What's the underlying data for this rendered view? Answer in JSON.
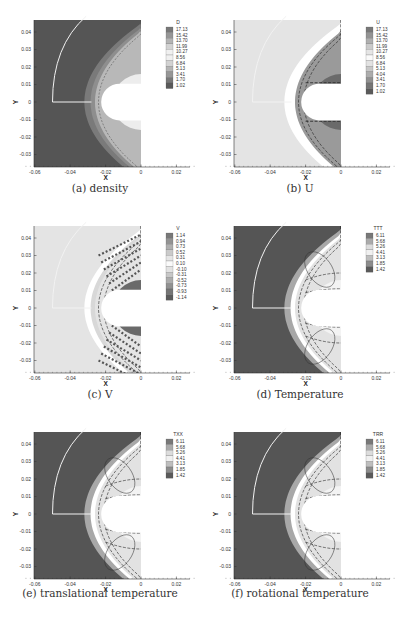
{
  "figure": {
    "panels": [
      {
        "id": "a",
        "caption": "(a) density",
        "variable": "D",
        "legend": [
          "17.13",
          "15.42",
          "13.70",
          "11.99",
          "10.27",
          "8.56",
          "6.84",
          "5.13",
          "3.41",
          "1.70",
          "1.02"
        ]
      },
      {
        "id": "b",
        "caption": "(b) U",
        "variable": "U",
        "legend": [
          "17.13",
          "15.42",
          "13.70",
          "11.99",
          "10.27",
          "8.56",
          "6.84",
          "5.13",
          "4.04",
          "3.41",
          "1.70",
          "1.02"
        ]
      },
      {
        "id": "c",
        "caption": "(c) V",
        "variable": "V",
        "legend": [
          "1.14",
          "0.94",
          "0.73",
          "0.52",
          "0.31",
          "0.10",
          "-0.10",
          "-0.31",
          "-0.52",
          "-0.73",
          "-0.93",
          "-1.14"
        ]
      },
      {
        "id": "d",
        "caption": "(d) Temperature",
        "variable": "TTT",
        "legend": [
          "6.11",
          "5.68",
          "5.26",
          "4.41",
          "3.13",
          "1.85",
          "1.42"
        ]
      },
      {
        "id": "e",
        "caption": "(e) translational temperature",
        "variable": "TXX",
        "legend": [
          "6.11",
          "5.68",
          "5.26",
          "4.41",
          "3.13",
          "1.85",
          "1.42"
        ]
      },
      {
        "id": "f",
        "caption": "(f) rotational temperature",
        "variable": "TRR",
        "legend": [
          "6.11",
          "5.68",
          "5.26",
          "4.41",
          "3.13",
          "1.85",
          "1.42"
        ]
      }
    ],
    "axes": {
      "xlabel": "X",
      "ylabel": "Y",
      "xticks": [
        "-0.06",
        "-0.04",
        "-0.02",
        "0",
        "0.02"
      ],
      "yticks": [
        "0.04",
        "0.03",
        "0.02",
        "0.01",
        "0",
        "-0.01",
        "-0.02",
        "-0.03"
      ]
    }
  },
  "chart_data": [
    {
      "type": "heatmap",
      "title": "(a) density",
      "xlabel": "X",
      "ylabel": "Y",
      "xlim": [
        -0.065,
        0.03
      ],
      "ylim": [
        -0.039,
        0.047
      ],
      "legend_title": "D",
      "levels": [
        17.13,
        15.42,
        13.7,
        11.99,
        10.27,
        8.56,
        6.84,
        5.13,
        3.41,
        1.7,
        1.02
      ],
      "grid": false,
      "legend_position": "right"
    },
    {
      "type": "heatmap",
      "title": "(b) U",
      "xlabel": "X",
      "ylabel": "Y",
      "xlim": [
        -0.065,
        0.03
      ],
      "ylim": [
        -0.039,
        0.047
      ],
      "legend_title": "U",
      "levels": [
        17.13,
        15.42,
        13.7,
        11.99,
        10.27,
        8.56,
        6.84,
        5.13,
        4.04,
        3.41,
        1.7,
        1.02
      ],
      "grid": false,
      "legend_position": "right"
    },
    {
      "type": "heatmap",
      "title": "(c) V",
      "xlabel": "X",
      "ylabel": "Y",
      "xlim": [
        -0.065,
        0.03
      ],
      "ylim": [
        -0.039,
        0.047
      ],
      "legend_title": "V",
      "levels": [
        1.14,
        0.94,
        0.73,
        0.52,
        0.31,
        0.1,
        -0.1,
        -0.31,
        -0.52,
        -0.73,
        -0.93,
        -1.14
      ],
      "grid": false,
      "legend_position": "right"
    },
    {
      "type": "heatmap",
      "title": "(d) Temperature",
      "xlabel": "X",
      "ylabel": "Y",
      "xlim": [
        -0.065,
        0.03
      ],
      "ylim": [
        -0.039,
        0.047
      ],
      "legend_title": "TTT",
      "levels": [
        6.11,
        5.68,
        5.26,
        4.41,
        3.13,
        1.85,
        1.42
      ],
      "grid": false,
      "legend_position": "right"
    },
    {
      "type": "heatmap",
      "title": "(e) translational temperature",
      "xlabel": "X",
      "ylabel": "Y",
      "xlim": [
        -0.065,
        0.03
      ],
      "ylim": [
        -0.039,
        0.047
      ],
      "legend_title": "TXX",
      "levels": [
        6.11,
        5.68,
        5.26,
        4.41,
        3.13,
        1.85,
        1.42
      ],
      "grid": false,
      "legend_position": "right"
    },
    {
      "type": "heatmap",
      "title": "(f) rotational temperature",
      "xlabel": "X",
      "ylabel": "Y",
      "xlim": [
        -0.065,
        0.03
      ],
      "ylim": [
        -0.039,
        0.047
      ],
      "legend_title": "TRR",
      "levels": [
        6.11,
        5.68,
        5.26,
        4.41,
        3.13,
        1.85,
        1.42
      ],
      "grid": false,
      "legend_position": "right"
    }
  ],
  "colors": {
    "dark_field": "#555555",
    "light_field": "#e4e4e4",
    "mid_gray": "#9a9a9a",
    "shock_gray": "#7a7a7a",
    "white": "#ffffff"
  }
}
